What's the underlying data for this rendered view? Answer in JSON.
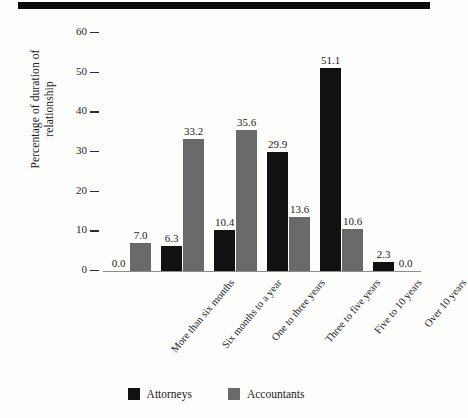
{
  "figure": {
    "background_color": "#fdfdfb",
    "has_top_rule": true
  },
  "chart_data": {
    "type": "bar",
    "title": "",
    "subtitle": "",
    "xlabel": "",
    "ylabel": "Percentage of duration of relationship",
    "ylabel_line1": "Percentage of duration of",
    "ylabel_line2": "relationship",
    "ylim": [
      0,
      60
    ],
    "yticks": [
      0,
      10,
      20,
      30,
      40,
      50,
      60
    ],
    "ytick_labels": [
      "0",
      "10",
      "20",
      "30",
      "40",
      "50",
      "60"
    ],
    "grid": false,
    "legend_position": "bottom-center",
    "categories": [
      "More than six months",
      "Six months to a year",
      "One to three years",
      "Three to five years",
      "Five to 10 years",
      "Over 10 years"
    ],
    "series": [
      {
        "name": "Attorneys",
        "color": "#111111",
        "values": [
          0.0,
          6.3,
          10.4,
          29.9,
          51.1,
          2.3
        ],
        "value_labels": [
          "0.0",
          "6.3",
          "10.4",
          "29.9",
          "51.1",
          "2.3"
        ]
      },
      {
        "name": "Accountants",
        "color": "#6a6a6a",
        "values": [
          7.0,
          33.2,
          35.6,
          13.6,
          10.6,
          0.0
        ],
        "value_labels": [
          "7.0",
          "33.2",
          "35.6",
          "13.6",
          "10.6",
          "0.0"
        ]
      }
    ]
  },
  "legend": {
    "items": [
      {
        "label": "Attorneys",
        "color": "#111111"
      },
      {
        "label": "Accountants",
        "color": "#6a6a6a"
      }
    ]
  }
}
